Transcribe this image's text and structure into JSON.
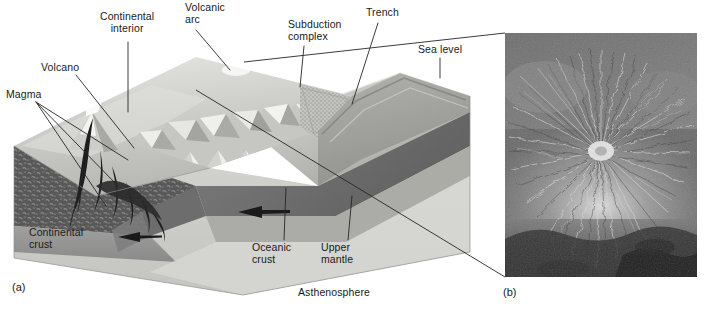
{
  "figure": {
    "panel_a_id": "(a)",
    "panel_b_id": "(b)"
  },
  "panel_a": {
    "caption_id": "(a)",
    "type": "3d-block-diagram",
    "labels": [
      {
        "key": "continental_interior",
        "text": "Continental\ninterior",
        "x": 100,
        "y": 16
      },
      {
        "key": "volcanic_arc",
        "text": "Volcanic\narc",
        "x": 186,
        "y": 4
      },
      {
        "key": "subduction_complex",
        "text": "Subduction\ncomplex",
        "x": 288,
        "y": 22
      },
      {
        "key": "trench",
        "text": "Trench",
        "x": 367,
        "y": 9
      },
      {
        "key": "sea_level",
        "text": "Sea level",
        "x": 419,
        "y": 48
      },
      {
        "key": "volcano",
        "text": "Volcano",
        "x": 41,
        "y": 63
      },
      {
        "key": "magma",
        "text": "Magma",
        "x": 7,
        "y": 90
      },
      {
        "key": "continental_crust",
        "text": "Continental\ncrust",
        "x": 30,
        "y": 228
      },
      {
        "key": "oceanic_crust",
        "text": "Oceanic\ncrust",
        "x": 253,
        "y": 243
      },
      {
        "key": "upper_mantle",
        "text": "Upper\nmantle",
        "x": 322,
        "y": 243
      },
      {
        "key": "asthenosphere",
        "text": "Asthenosphere",
        "x": 299,
        "y": 288
      }
    ],
    "features": [
      "continental interior plateau",
      "volcanic arc mountain range",
      "subduction complex accretionary wedge",
      "oceanic trench",
      "sea level plane",
      "stratovolcano with ash plume",
      "rising magma conduits",
      "continental crust layer",
      "subducting oceanic crust slab",
      "upper mantle layer",
      "asthenosphere"
    ],
    "motion_arrows": [
      {
        "key": "arrow-oceanic-plate-left",
        "direction": "left"
      },
      {
        "key": "arrow-oceanic-plate-right",
        "direction": "left"
      }
    ]
  },
  "panel_b": {
    "caption_id": "(b)",
    "type": "aerial-photograph",
    "subject": "volcano with radial drainage pattern",
    "rendering": "grayscale"
  },
  "colors": {
    "background": "#ffffff",
    "text": "#1a1a1a",
    "leader_line": "#2a2a2a",
    "land_surface_light": "#d9d9d6",
    "land_surface_mid": "#bdbdb9",
    "crust_dark": "#5c5c5c",
    "mantle_mid": "#8f8f8f",
    "asthenosphere": "#cfcfcc",
    "ocean_surface": "#c9c9c5",
    "magma_dark": "#232323",
    "photo_base": "#8a8a8a"
  }
}
